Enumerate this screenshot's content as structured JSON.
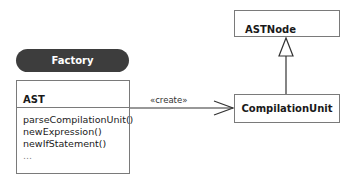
{
  "diagram": {
    "type": "uml-class-diagram",
    "stereotype_group": {
      "label": "Factory"
    },
    "classes": [
      {
        "name": "AST",
        "operations": [
          "parseCompilationUnit()",
          "newExpression()",
          "newIfStatement()",
          "..."
        ]
      },
      {
        "name": "ASTNode",
        "operations": []
      },
      {
        "name": "CompilationUnit",
        "operations": []
      }
    ],
    "relations": [
      {
        "from": "AST",
        "to": "CompilationUnit",
        "kind": "dependency",
        "label": "«create»"
      },
      {
        "from": "CompilationUnit",
        "to": "ASTNode",
        "kind": "generalization",
        "label": ""
      }
    ]
  }
}
